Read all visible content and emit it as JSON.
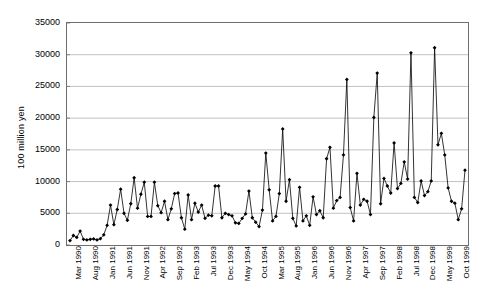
{
  "chart_data": {
    "type": "line",
    "title": "",
    "xlabel": "",
    "ylabel": "100 million yen",
    "ylim": [
      0,
      35000
    ],
    "y_ticks": [
      0,
      5000,
      10000,
      15000,
      20000,
      25000,
      30000,
      35000
    ],
    "y_tick_labels": [
      "0",
      "5000",
      "10000",
      "15000",
      "20000",
      "25000",
      "30000",
      "35000"
    ],
    "grid": "horizontal",
    "legend": "none",
    "marker": "filled-diamond",
    "line_color": "#000000",
    "marker_color": "#000000",
    "grid_color": "#a6a6a6",
    "axis_color": "#6e6e6e",
    "background": "#ffffff",
    "x_tick_interval_months": 5,
    "x_tick_labels": [
      "Mar 1990",
      "Aug 1990",
      "Jan 1991",
      "Jun 1991",
      "Nov 1991",
      "Apr 1992",
      "Sep 1992",
      "Feb 1993",
      "Jul 1993",
      "Dec 1993",
      "May 1994",
      "Oct 1994",
      "Mar 1995",
      "Aug 1995",
      "Jan 1996",
      "Jun 1996",
      "Nov 1996",
      "Apr 1997",
      "Sep 1997",
      "Feb 1998",
      "Jul 1998",
      "Dec 1998",
      "May 1999",
      "Oct 1999"
    ],
    "x": [
      "Mar 1990",
      "Apr 1990",
      "May 1990",
      "Jun 1990",
      "Jul 1990",
      "Aug 1990",
      "Sep 1990",
      "Oct 1990",
      "Nov 1990",
      "Dec 1990",
      "Jan 1991",
      "Feb 1991",
      "Mar 1991",
      "Apr 1991",
      "May 1991",
      "Jun 1991",
      "Jul 1991",
      "Aug 1991",
      "Sep 1991",
      "Oct 1991",
      "Nov 1991",
      "Dec 1991",
      "Jan 1992",
      "Feb 1992",
      "Mar 1992",
      "Apr 1992",
      "May 1992",
      "Jun 1992",
      "Jul 1992",
      "Aug 1992",
      "Sep 1992",
      "Oct 1992",
      "Nov 1992",
      "Dec 1992",
      "Jan 1993",
      "Feb 1993",
      "Mar 1993",
      "Apr 1993",
      "May 1993",
      "Jun 1993",
      "Jul 1993",
      "Aug 1993",
      "Sep 1993",
      "Oct 1993",
      "Nov 1993",
      "Dec 1993",
      "Jan 1994",
      "Feb 1994",
      "Mar 1994",
      "Apr 1994",
      "May 1994",
      "Jun 1994",
      "Jul 1994",
      "Aug 1994",
      "Sep 1994",
      "Oct 1994",
      "Nov 1994",
      "Dec 1994",
      "Jan 1995",
      "Feb 1995",
      "Mar 1995",
      "Apr 1995",
      "May 1995",
      "Jun 1995",
      "Jul 1995",
      "Aug 1995",
      "Sep 1995",
      "Oct 1995",
      "Nov 1995",
      "Dec 1995",
      "Jan 1996",
      "Feb 1996",
      "Mar 1996",
      "Apr 1996",
      "May 1996",
      "Jun 1996",
      "Jul 1996",
      "Aug 1996",
      "Sep 1996",
      "Oct 1996",
      "Nov 1996",
      "Dec 1996",
      "Jan 1997",
      "Feb 1997",
      "Mar 1997",
      "Apr 1997",
      "May 1997",
      "Jun 1997",
      "Jul 1997",
      "Aug 1997",
      "Sep 1997",
      "Oct 1997",
      "Nov 1997",
      "Dec 1997",
      "Jan 1998",
      "Feb 1998",
      "Mar 1998",
      "Apr 1998",
      "May 1998",
      "Jun 1998",
      "Jul 1998",
      "Aug 1998",
      "Sep 1998",
      "Oct 1998",
      "Nov 1998",
      "Dec 1998",
      "Jan 1999",
      "Feb 1999",
      "Mar 1999",
      "Apr 1999",
      "May 1999",
      "Jun 1999",
      "Jul 1999",
      "Aug 1999",
      "Sep 1999",
      "Oct 1999",
      "Nov 1999",
      "Dec 1999"
    ],
    "values": [
      700,
      1500,
      1200,
      2200,
      900,
      800,
      900,
      950,
      800,
      1000,
      1600,
      3100,
      6300,
      3200,
      5600,
      8800,
      5000,
      3900,
      6500,
      10600,
      5800,
      8000,
      9900,
      4500,
      4500,
      9900,
      6200,
      5100,
      6900,
      4000,
      5700,
      8100,
      8200,
      4300,
      2500,
      7900,
      4000,
      6600,
      5200,
      6300,
      4200,
      4700,
      4600,
      9300,
      9300,
      4300,
      5000,
      4800,
      4600,
      3500,
      3400,
      4200,
      4900,
      8500,
      4300,
      3600,
      2900,
      5500,
      14500,
      8700,
      3800,
      4500,
      8100,
      18300,
      6900,
      10300,
      4200,
      3000,
      9100,
      3800,
      4600,
      3100,
      7600,
      4800,
      5400,
      4300,
      13600,
      15400,
      5800,
      7000,
      7500,
      14200,
      26100,
      5900,
      3800,
      11300,
      6300,
      7200,
      6900,
      4800,
      20100,
      27100,
      6500,
      10500,
      9300,
      8200,
      16100,
      8900,
      9700,
      13100,
      10400,
      30300,
      7500,
      6700,
      10100,
      7800,
      8400,
      10100,
      31100,
      15800,
      17600,
      14200,
      9000,
      6900,
      6600,
      4000,
      5700,
      11800
    ]
  }
}
